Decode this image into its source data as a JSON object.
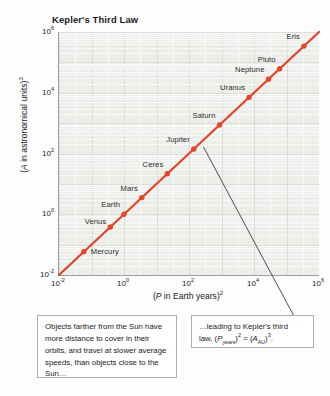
{
  "chart_data": {
    "type": "scatter",
    "title": "Kepler's Third Law",
    "xlabel": "(P in Earth years)2",
    "ylabel": "(A in astronomical units)3",
    "xscale": "log",
    "yscale": "log",
    "xlim": [
      0.01,
      1000000
    ],
    "ylim": [
      0.01,
      1000000
    ],
    "grid": true,
    "legend": "none",
    "x_ticks": [
      "10-2",
      "100",
      "102",
      "104",
      "106"
    ],
    "y_ticks": [
      "10-2",
      "100",
      "102",
      "104",
      "106"
    ],
    "series_color": "#e2462b",
    "points": [
      {
        "name": "Mercury",
        "x": 0.0581,
        "y": 0.0581,
        "label_dx": 7,
        "label_dy": -1
      },
      {
        "name": "Venus",
        "x": 0.3786,
        "y": 0.3786,
        "label_dx": -36,
        "label_dy": -6
      },
      {
        "name": "Earth",
        "x": 1.0,
        "y": 1.0,
        "label_dx": -32,
        "label_dy": -10
      },
      {
        "name": "Mars",
        "x": 3.537,
        "y": 3.537,
        "label_dx": -30,
        "label_dy": -10
      },
      {
        "name": "Ceres",
        "x": 21.5,
        "y": 21.5,
        "label_dx": -34,
        "label_dy": -10
      },
      {
        "name": "Jupiter",
        "x": 140.7,
        "y": 140.7,
        "label_dx": -40,
        "label_dy": -10
      },
      {
        "name": "Saturn",
        "x": 867.0,
        "y": 867.0,
        "label_dx": -38,
        "label_dy": -10
      },
      {
        "name": "Uranus",
        "x": 7060.0,
        "y": 7060.0,
        "label_dx": -42,
        "label_dy": -10
      },
      {
        "name": "Neptune",
        "x": 27900.0,
        "y": 27900.0,
        "label_dx": -48,
        "label_dy": -10
      },
      {
        "name": "Pluto",
        "x": 61500.0,
        "y": 61500.0,
        "label_dx": -34,
        "label_dy": -10
      },
      {
        "name": "Eris",
        "x": 344000.0,
        "y": 344000.0,
        "label_dx": -30,
        "label_dy": -10
      }
    ]
  },
  "title": "Kepler's Third Law",
  "axes": {
    "y_label_parts": {
      "open": "(",
      "sym": "A",
      "rest": " in astronomical units)",
      "exp": "3"
    },
    "x_label_parts": {
      "open": "(",
      "sym": "P",
      "rest": " in Earth years)",
      "exp": "2"
    },
    "y_ticks": [
      {
        "mantissa": "10",
        "exponent": "6"
      },
      {
        "mantissa": "10",
        "exponent": "4"
      },
      {
        "mantissa": "10",
        "exponent": "2"
      },
      {
        "mantissa": "10",
        "exponent": "0"
      },
      {
        "mantissa": "10",
        "exponent": "-2"
      }
    ],
    "x_ticks": [
      {
        "mantissa": "10",
        "exponent": "-2"
      },
      {
        "mantissa": "10",
        "exponent": "0"
      },
      {
        "mantissa": "10",
        "exponent": "2"
      },
      {
        "mantissa": "10",
        "exponent": "4"
      },
      {
        "mantissa": "10",
        "exponent": "6"
      }
    ]
  },
  "callouts": {
    "left": "Objects farther from the Sun have more distance to cover in their orbits, and travel at slower average speeds, than objects close to the Sun…",
    "right_line1": "…leading to Kepler's third",
    "right_formula": {
      "lead": "law, (",
      "p_sym": "P",
      "p_sub": "years",
      "p_close": ")",
      "p_exp": "2",
      "eq": " = (",
      "a_sym": "A",
      "a_sub": "AU",
      "a_close": ")",
      "a_exp": "3",
      "period": "."
    }
  },
  "colors": {
    "series": "#e2462b",
    "plot_bg": "#eceeea",
    "axis": "#9aa0a0",
    "callout_border": "#a9b0b4",
    "leader": "#3a3a3a"
  }
}
